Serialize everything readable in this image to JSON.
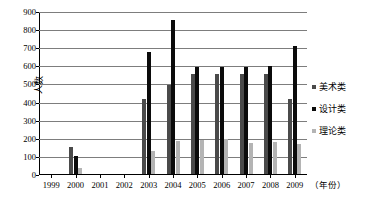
{
  "chart_data": {
    "type": "bar",
    "title": "",
    "xlabel": "（年份）",
    "ylabel": "人数",
    "ylim": [
      0,
      900
    ],
    "ytick_step": 100,
    "yticks": [
      "0",
      "100",
      "200",
      "300",
      "400",
      "500",
      "600",
      "700",
      "800",
      "900"
    ],
    "grid": true,
    "legend_position": "right",
    "categories": [
      "1999",
      "2000",
      "2001",
      "2002",
      "2003",
      "2004",
      "2005",
      "2006",
      "2007",
      "2008",
      "2009"
    ],
    "series": [
      {
        "name": "美术类",
        "color": "#4a4a4a",
        "values": [
          0,
          150,
          0,
          0,
          415,
          490,
          550,
          552,
          553,
          552,
          415
        ]
      },
      {
        "name": "设计类",
        "color": "#0b0b0b",
        "values": [
          0,
          100,
          0,
          0,
          675,
          850,
          590,
          590,
          593,
          595,
          705
        ]
      },
      {
        "name": "理论类",
        "color": "#b4b4b4",
        "values": [
          0,
          35,
          0,
          0,
          125,
          185,
          190,
          192,
          172,
          175,
          165
        ]
      }
    ]
  }
}
